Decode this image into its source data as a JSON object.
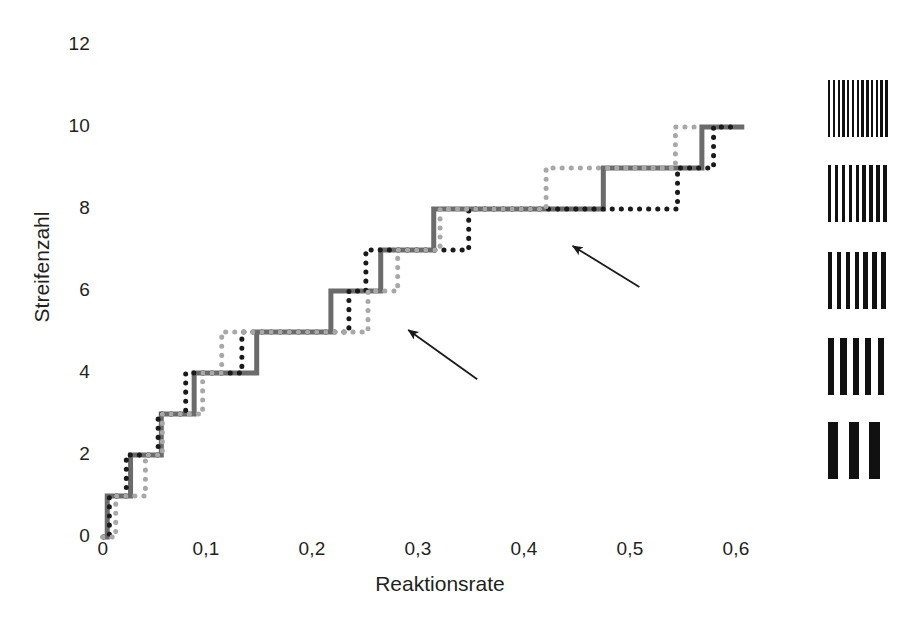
{
  "chart_data": {
    "type": "line",
    "title": "",
    "xlabel": "Reaktionsrate",
    "ylabel": "Streifenzahl",
    "xlim": [
      0,
      0.64
    ],
    "ylim": [
      0,
      12
    ],
    "grid": false,
    "legend_position": "right-patches",
    "xtick_labels": [
      "0",
      "0,1",
      "0,2",
      "0,3",
      "0,4",
      "0,5",
      "0,6"
    ],
    "xtick_values": [
      0,
      0.1,
      0.2,
      0.3,
      0.4,
      0.5,
      0.6
    ],
    "ytick_labels": [
      "0",
      "2",
      "4",
      "6",
      "8",
      "10",
      "12"
    ],
    "ytick_values": [
      0,
      2,
      4,
      6,
      8,
      10,
      12
    ],
    "series": [
      {
        "name": "solid-gray-staircase",
        "style": "solid",
        "color": "#6b6b6b",
        "width": 5,
        "points": [
          [
            0.0,
            0.0
          ],
          [
            0.004,
            0.0
          ],
          [
            0.004,
            1.0
          ],
          [
            0.026,
            1.0
          ],
          [
            0.026,
            2.0
          ],
          [
            0.055,
            2.0
          ],
          [
            0.055,
            3.0
          ],
          [
            0.086,
            3.0
          ],
          [
            0.086,
            4.0
          ],
          [
            0.145,
            4.0
          ],
          [
            0.145,
            5.0
          ],
          [
            0.215,
            5.0
          ],
          [
            0.215,
            6.0
          ],
          [
            0.262,
            6.0
          ],
          [
            0.262,
            7.0
          ],
          [
            0.312,
            7.0
          ],
          [
            0.312,
            8.0
          ],
          [
            0.472,
            8.0
          ],
          [
            0.472,
            9.0
          ],
          [
            0.565,
            9.0
          ],
          [
            0.565,
            10.0
          ],
          [
            0.605,
            10.0
          ]
        ]
      },
      {
        "name": "black-dotted-staircase",
        "style": "dotted",
        "color": "#1a1a1a",
        "width": 5,
        "points": [
          [
            0.0,
            0.0
          ],
          [
            0.006,
            0.0
          ],
          [
            0.006,
            1.0
          ],
          [
            0.022,
            1.0
          ],
          [
            0.022,
            2.0
          ],
          [
            0.052,
            2.0
          ],
          [
            0.052,
            3.0
          ],
          [
            0.078,
            3.0
          ],
          [
            0.078,
            4.0
          ],
          [
            0.131,
            4.0
          ],
          [
            0.131,
            5.0
          ],
          [
            0.232,
            5.0
          ],
          [
            0.232,
            6.0
          ],
          [
            0.248,
            6.0
          ],
          [
            0.248,
            7.0
          ],
          [
            0.345,
            7.0
          ],
          [
            0.345,
            8.0
          ],
          [
            0.542,
            8.0
          ],
          [
            0.542,
            9.0
          ],
          [
            0.576,
            9.0
          ],
          [
            0.576,
            10.0
          ],
          [
            0.6,
            10.0
          ]
        ]
      },
      {
        "name": "light-gray-dotted-staircase",
        "style": "dotted",
        "color": "#a8a8a8",
        "width": 5,
        "points": [
          [
            0.0,
            0.0
          ],
          [
            0.012,
            0.0
          ],
          [
            0.012,
            1.0
          ],
          [
            0.04,
            1.0
          ],
          [
            0.04,
            2.0
          ],
          [
            0.056,
            2.0
          ],
          [
            0.056,
            3.0
          ],
          [
            0.094,
            3.0
          ],
          [
            0.094,
            4.0
          ],
          [
            0.112,
            4.0
          ],
          [
            0.112,
            5.0
          ],
          [
            0.25,
            5.0
          ],
          [
            0.25,
            6.0
          ],
          [
            0.278,
            6.0
          ],
          [
            0.278,
            7.0
          ],
          [
            0.318,
            7.0
          ],
          [
            0.318,
            8.0
          ],
          [
            0.418,
            8.0
          ],
          [
            0.418,
            9.0
          ],
          [
            0.54,
            9.0
          ],
          [
            0.54,
            10.0
          ],
          [
            0.566,
            10.0
          ]
        ]
      }
    ],
    "annotations": [
      {
        "name": "arrow-reversal-lower",
        "tail": [
          0.353,
          3.85
        ],
        "head": [
          0.288,
          5.05
        ]
      },
      {
        "name": "arrow-reversal-upper",
        "tail": [
          0.506,
          6.1
        ],
        "head": [
          0.443,
          7.1
        ]
      }
    ],
    "legend_patches": [
      {
        "name": "grating-patch-1",
        "stripes": 13,
        "label": "finest grating"
      },
      {
        "name": "grating-patch-2",
        "stripes": 9,
        "label": "fine grating"
      },
      {
        "name": "grating-patch-3",
        "stripes": 7,
        "label": "medium grating"
      },
      {
        "name": "grating-patch-4",
        "stripes": 5,
        "label": "coarse grating"
      },
      {
        "name": "grating-patch-5",
        "stripes": 3,
        "label": "coarsest grating"
      }
    ]
  }
}
